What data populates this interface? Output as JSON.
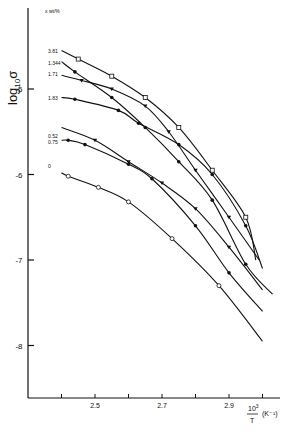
{
  "chart_data": {
    "type": "line",
    "title": "",
    "xlabel": "10^3 / T (K^-1)",
    "ylabel": "log10 σ",
    "xlim": [
      2.4,
      3.05
    ],
    "ylim": [
      -8.6,
      -4.2
    ],
    "grid": false,
    "x_ticks": [
      2.4,
      2.5,
      2.6,
      2.7,
      2.8,
      2.9,
      3.0
    ],
    "x_tick_labels": [
      "",
      "2.5",
      "",
      "2.7",
      "",
      "2.9",
      ""
    ],
    "y_ticks": [
      -5,
      -6,
      -7,
      -8
    ],
    "y_tick_labels": [
      "-5",
      "-6",
      "-7",
      "-8"
    ],
    "legend_header": "x wt/%",
    "legend_position": "left, inline labels",
    "series": [
      {
        "name": "3.81",
        "marker": "open-square",
        "label_y": -4.55,
        "x": [
          2.4,
          2.45,
          2.55,
          2.65,
          2.75,
          2.85,
          2.95,
          2.98
        ],
        "y": [
          -4.55,
          -4.65,
          -4.85,
          -5.1,
          -5.45,
          -5.95,
          -6.5,
          -7.0
        ]
      },
      {
        "name": "1.344",
        "marker": "filled-circle",
        "label_y": -4.7,
        "x": [
          2.4,
          2.44,
          2.55,
          2.65,
          2.75,
          2.85,
          2.95,
          3.03
        ],
        "y": [
          -4.68,
          -4.8,
          -5.1,
          -5.45,
          -5.85,
          -6.3,
          -7.05,
          -7.4
        ]
      },
      {
        "name": "1.71",
        "marker": "filled-triangle",
        "label_y": -4.83,
        "x": [
          2.4,
          2.46,
          2.55,
          2.65,
          2.72,
          2.8,
          2.9,
          2.99
        ],
        "y": [
          -4.84,
          -4.9,
          -5.0,
          -5.2,
          -5.5,
          -5.95,
          -6.5,
          -7.0
        ]
      },
      {
        "name": "1.83",
        "marker": "filled-circle",
        "label_y": -5.1,
        "x": [
          2.4,
          2.44,
          2.57,
          2.63,
          2.75,
          2.85,
          2.95,
          3.0
        ],
        "y": [
          -5.1,
          -5.12,
          -5.25,
          -5.4,
          -5.65,
          -6.0,
          -6.6,
          -7.1
        ]
      },
      {
        "name": "0.52",
        "marker": "filled-triangle",
        "label_y": -5.55,
        "x": [
          2.4,
          2.5,
          2.6,
          2.7,
          2.8,
          2.9,
          3.0
        ],
        "y": [
          -5.45,
          -5.6,
          -5.85,
          -6.1,
          -6.4,
          -6.85,
          -7.35
        ]
      },
      {
        "name": "0.75",
        "marker": "filled-circle",
        "label_y": -5.62,
        "x": [
          2.4,
          2.42,
          2.47,
          2.6,
          2.67,
          2.8,
          2.9,
          3.0
        ],
        "y": [
          -5.6,
          -5.6,
          -5.65,
          -5.88,
          -6.05,
          -6.6,
          -7.15,
          -7.6
        ]
      },
      {
        "name": "0",
        "marker": "open-circle",
        "label_y": -5.9,
        "x": [
          2.4,
          2.42,
          2.51,
          2.6,
          2.73,
          2.87,
          3.0
        ],
        "y": [
          -5.98,
          -6.02,
          -6.15,
          -6.32,
          -6.75,
          -7.3,
          -7.95
        ]
      }
    ]
  }
}
